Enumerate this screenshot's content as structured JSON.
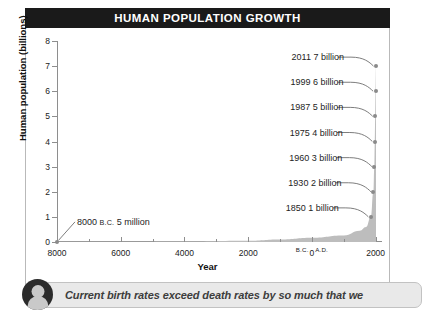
{
  "figure": {
    "title": "HUMAN POPULATION GROWTH",
    "xtitle": "Year",
    "ytitle": "Human population (billions)"
  },
  "caption": {
    "text": "Current birth rates exceed death rates by so much that we",
    "avatar_icon": "person-avatar-icon"
  },
  "chart_data": {
    "type": "area",
    "title": "HUMAN POPULATION GROWTH",
    "xlabel": "Year",
    "ylabel": "Human population (billions)",
    "xlim": [
      -8000,
      2200
    ],
    "ylim": [
      0,
      8
    ],
    "grid": false,
    "legend": false,
    "y_ticks": [
      0,
      1,
      2,
      3,
      4,
      5,
      6,
      7,
      8
    ],
    "y_tick_labels": [
      "0",
      "1",
      "2",
      "3",
      "4",
      "5",
      "6",
      "7",
      "8"
    ],
    "x_ticks": [
      -8000,
      -6000,
      -4000,
      -2000,
      0,
      2000
    ],
    "x_tick_labels": [
      "8000",
      "6000",
      "4000",
      "2000",
      "0",
      "2000"
    ],
    "x_minor_ticks": [
      -7000,
      -5000,
      -3000,
      -1000,
      1000
    ],
    "era_left": "B.C.",
    "era_right": "A.D.",
    "x": [
      -8000,
      -6000,
      -4000,
      -2000,
      -1000,
      0,
      1000,
      1500,
      1700,
      1850,
      1930,
      1960,
      1975,
      1987,
      1999,
      2011
    ],
    "y": [
      0.005,
      0.01,
      0.02,
      0.05,
      0.1,
      0.17,
      0.26,
      0.45,
      0.6,
      1,
      2,
      3,
      4,
      5,
      6,
      7
    ],
    "points": [
      {
        "year": "8000 B.C.",
        "label": "8000 B.C. 5 million",
        "population": 0.005,
        "population_text": "5 million"
      },
      {
        "year": "1850",
        "label": "1850 1 billion",
        "population": 1,
        "population_text": "1 billion"
      },
      {
        "year": "1930",
        "label": "1930 2 billion",
        "population": 2,
        "population_text": "2 billion"
      },
      {
        "year": "1960",
        "label": "1960 3 billion",
        "population": 3,
        "population_text": "3 billion"
      },
      {
        "year": "1975",
        "label": "1975 4 billion",
        "population": 4,
        "population_text": "4 billion"
      },
      {
        "year": "1987",
        "label": "1987 5 billion",
        "population": 5,
        "population_text": "5 billion"
      },
      {
        "year": "1999",
        "label": "1999 6 billion",
        "population": 6,
        "population_text": "6 billion"
      },
      {
        "year": "2011",
        "label": "2011 7 billion",
        "population": 7,
        "population_text": "7 billion"
      }
    ],
    "colors": {
      "title_bar": "#1a1a1a",
      "title_text": "#ffffff",
      "area_fill": "#bdbdbd",
      "marker": "#8a8a8a",
      "axis": "#8e8e8e",
      "caption_bg": "#e9e9e9"
    }
  }
}
